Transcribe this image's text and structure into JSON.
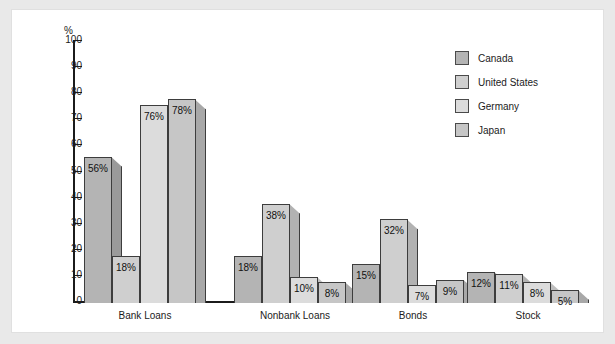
{
  "chart_data": {
    "type": "bar",
    "title": "",
    "subtitle": "",
    "xlabel": "",
    "ylabel": "%",
    "ylim": [
      0,
      100
    ],
    "ytick_labels": [
      "100",
      "90",
      "80",
      "70",
      "60",
      "50",
      "40",
      "30",
      "20",
      "10",
      "0"
    ],
    "ytick_values": [
      100,
      90,
      80,
      70,
      60,
      50,
      40,
      30,
      20,
      10,
      0
    ],
    "grid": false,
    "legend_position": "top-right",
    "categories": [
      "Bank Loans",
      "Nonbank Loans",
      "Bonds",
      "Stock"
    ],
    "series": [
      {
        "name": "Canada",
        "color": "#b4b4b4",
        "side_color": "#9a9a9a",
        "values": [
          56,
          18,
          15,
          12
        ],
        "labels": [
          "56%",
          "18%",
          "15%",
          "12%"
        ]
      },
      {
        "name": "United States",
        "color": "#cfcfcf",
        "side_color": "#b2b2b2",
        "values": [
          18,
          38,
          32,
          11
        ],
        "labels": [
          "18%",
          "38%",
          "32%",
          "11%"
        ]
      },
      {
        "name": "Germany",
        "color": "#dcdcdc",
        "side_color": "#bfbfbf",
        "values": [
          76,
          10,
          7,
          8
        ],
        "labels": [
          "76%",
          "10%",
          "7%",
          "8%"
        ]
      },
      {
        "name": "Japan",
        "color": "#c6c6c6",
        "side_color": "#a8a8a8",
        "values": [
          78,
          8,
          9,
          5
        ],
        "labels": [
          "78%",
          "8%",
          "9%",
          "5%"
        ]
      }
    ],
    "legend": [
      {
        "label": "Canada",
        "color": "#b4b4b4"
      },
      {
        "label": "United States",
        "color": "#cfcfcf"
      },
      {
        "label": "Germany",
        "color": "#dcdcdc"
      },
      {
        "label": "Japan",
        "color": "#c6c6c6"
      }
    ],
    "colors": {
      "axis": "#1b1b1b",
      "bar_outline": "#3d3d3d",
      "panel_background": "#ffffff",
      "page_background": "#e9e9e9",
      "label_text": "#111111"
    }
  }
}
